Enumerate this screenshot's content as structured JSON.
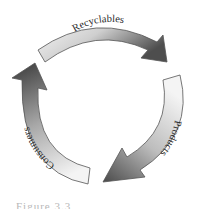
{
  "diagram": {
    "type": "cycle",
    "arrows": [
      {
        "label": "Recyclables",
        "from": "top-left",
        "to": "right"
      },
      {
        "label": "Products",
        "from": "right",
        "to": "bottom"
      },
      {
        "label": "Consumers",
        "from": "bottom-left",
        "to": "top-left"
      }
    ],
    "colors": {
      "light": "#f2f2f2",
      "dark": "#4a4a4a",
      "outline": "#555555"
    }
  },
  "caption": {
    "text": "Figure 3.3"
  }
}
